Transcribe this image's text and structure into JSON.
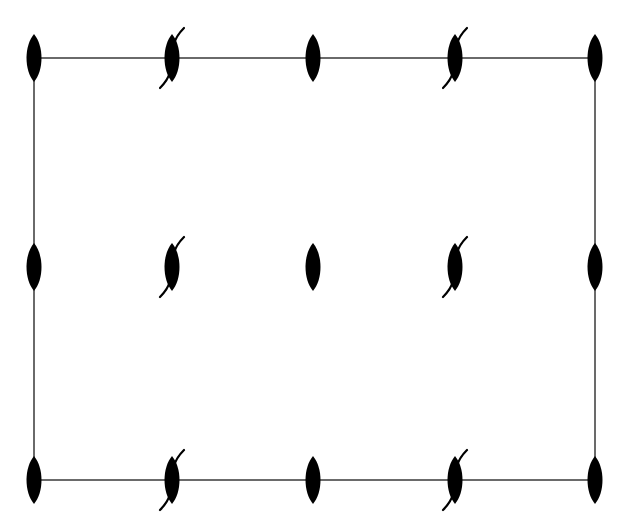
{
  "diagram": {
    "type": "symmetry-element-diagram",
    "colors": {
      "background": "#ffffff",
      "line": "#3a3a3a",
      "symbol": "#000000"
    },
    "cell": {
      "left": 34,
      "top": 58,
      "right": 595,
      "bottom": 480
    },
    "columns": [
      34,
      172,
      313,
      455,
      595
    ],
    "rows": [
      58,
      267,
      480
    ],
    "symbol_legend": {
      "two-fold-axis": "filled lens (2-fold rotation axis)",
      "two-fold-screw-axis": "filled lens with hooked tails (2-fold screw axis)"
    },
    "grid": [
      [
        "two-fold-axis",
        "two-fold-screw-axis",
        "two-fold-axis",
        "two-fold-screw-axis",
        "two-fold-axis"
      ],
      [
        "two-fold-axis",
        "two-fold-screw-axis",
        "two-fold-axis",
        "two-fold-screw-axis",
        "two-fold-axis"
      ],
      [
        "two-fold-axis",
        "two-fold-screw-axis",
        "two-fold-axis",
        "two-fold-screw-axis",
        "two-fold-axis"
      ]
    ]
  }
}
